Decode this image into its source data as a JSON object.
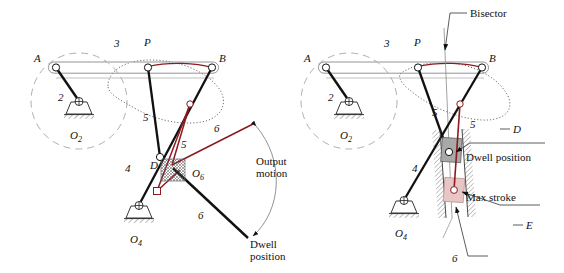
{
  "figure": {
    "background_color": "#ffffff",
    "line_color": "#000000",
    "accent_color": "#8c1a20",
    "ghost_color": "#b9b9b9",
    "slider_dwell_fill": "#a9a9a9",
    "slider_stroke_fill": "#e8c6c6"
  },
  "left_diagram": {
    "name": "rocker-output-dwell-linkage",
    "labels": {
      "point_a": "A",
      "point_b": "B",
      "point_p": "P",
      "point_d": "D",
      "pivot_o2": "O",
      "pivot_o2_sub": "2",
      "pivot_o4": "O",
      "pivot_o4_sub": "4",
      "pivot_o6": "O",
      "pivot_o6_sub": "6",
      "link2": "2",
      "link3": "3",
      "link4": "4",
      "link5_upper": "5",
      "link5_lower": "5",
      "link6_upper": "6",
      "link6_lower": "6",
      "output_motion_line1": "Output",
      "output_motion_line2": "motion",
      "dwell_line1": "Dwell",
      "dwell_line2": "position"
    }
  },
  "right_diagram": {
    "name": "slider-output-dwell-linkage",
    "labels": {
      "point_a": "A",
      "point_b": "B",
      "point_p": "P",
      "point_d": "D",
      "point_e": "E",
      "pivot_o2": "O",
      "pivot_o2_sub": "2",
      "pivot_o4": "O",
      "pivot_o4_sub": "4",
      "link2": "2",
      "link3": "3",
      "link4": "4",
      "link5_upper": "5",
      "link5_lower": "5",
      "link6": "6",
      "bisector": "Bisector",
      "dwell_position": "Dwell position",
      "max_stroke": "Max stroke"
    }
  }
}
